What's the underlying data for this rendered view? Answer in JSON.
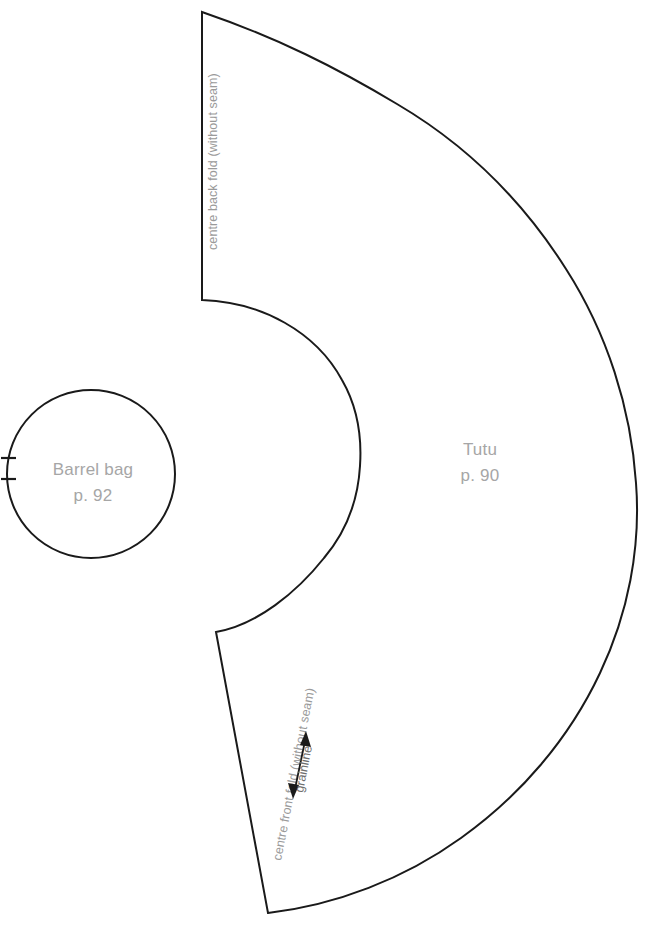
{
  "sheet": {
    "width": 650,
    "height": 927,
    "background": "#ffffff",
    "line_color": "#1a1a1a",
    "label_color": "#a6a6a6",
    "fold_label_color": "#9a9a9a"
  },
  "pieces": [
    {
      "id": "tutu",
      "name": "Tutu",
      "page": "p. 90",
      "labels": {
        "back_fold": "centre back fold (without seam)",
        "front_fold": "centre front fold (without seam)",
        "grainline": "grainline"
      },
      "title_x": 480,
      "title_y": 455,
      "page_y": 481
    },
    {
      "id": "barrel-bag",
      "name": "Barrel bag",
      "page": "p. 92",
      "center_x": 91,
      "center_y": 474,
      "radius": 84,
      "title_y": 470,
      "page_y": 496,
      "notches": [
        458,
        479
      ]
    }
  ],
  "geometry": {
    "tutu_path": "M 202 12 L 202 300 C 285 305 357 378 360 466 C 357 555 285 628 216 632 L 268 913 C 380 898 487 840 560 742 C 633 640 656 506 636 392 C 608 232 520 104 378 42 C 320 18 258 10 202 12 Z",
    "grainline": {
      "x1": 294,
      "y1": 795,
      "x2": 307,
      "y2": 735
    }
  }
}
